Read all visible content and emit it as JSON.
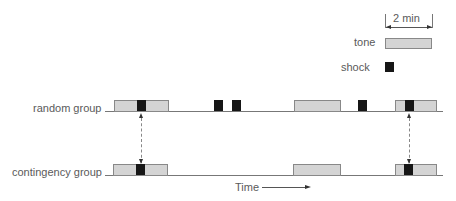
{
  "legend": {
    "duration_label": "2 min",
    "tone_label": "tone",
    "shock_label": "shock",
    "colors": {
      "tone": "#d4d4d4",
      "shock": "#161616"
    }
  },
  "rows": [
    {
      "label": "random group"
    },
    {
      "label": "contingency group"
    }
  ],
  "axis": {
    "time_label": "Time"
  }
}
